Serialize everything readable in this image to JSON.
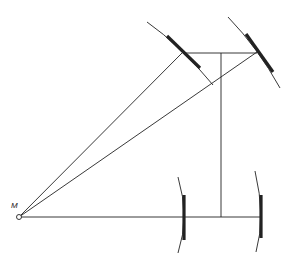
{
  "diagram": {
    "labels": {
      "point": "M"
    },
    "colors": {
      "stroke": "#222222",
      "background": "#ffffff"
    },
    "point_M": {
      "x": 19,
      "y": 217,
      "r": 2.5
    },
    "label_M": {
      "x": 11,
      "y": 208
    },
    "mirrors": [
      {
        "name": "upper-left-mirror",
        "arc": "M147,22 Q180,45 213,85",
        "thick": "M167,36 L200,68"
      },
      {
        "name": "upper-right-mirror",
        "arc": "M228,17 Q258,48 280,88",
        "thick": "M246,34 L273,72"
      },
      {
        "name": "lower-left-mirror",
        "arc": "M178,177 Q190,217 178,253",
        "thick": "M184,195 L184,240"
      },
      {
        "name": "lower-right-mirror",
        "arc": "M255,171 Q266,217 256,252",
        "thick": "M261,195 L261,238"
      }
    ],
    "lines": [
      {
        "name": "ray-to-upper-left-mirror",
        "x1": 19,
        "y1": 217,
        "x2": 183,
        "y2": 52
      },
      {
        "name": "ray-to-upper-right-mirror",
        "x1": 19,
        "y1": 217,
        "x2": 257,
        "y2": 52
      },
      {
        "name": "horizontal-axis",
        "x1": 21,
        "y1": 217,
        "x2": 261,
        "y2": 217
      },
      {
        "name": "upper-horizontal-beam",
        "x1": 183,
        "y1": 53,
        "x2": 257,
        "y2": 53
      },
      {
        "name": "vertical-beam",
        "x1": 221,
        "y1": 53,
        "x2": 221,
        "y2": 217
      }
    ]
  }
}
